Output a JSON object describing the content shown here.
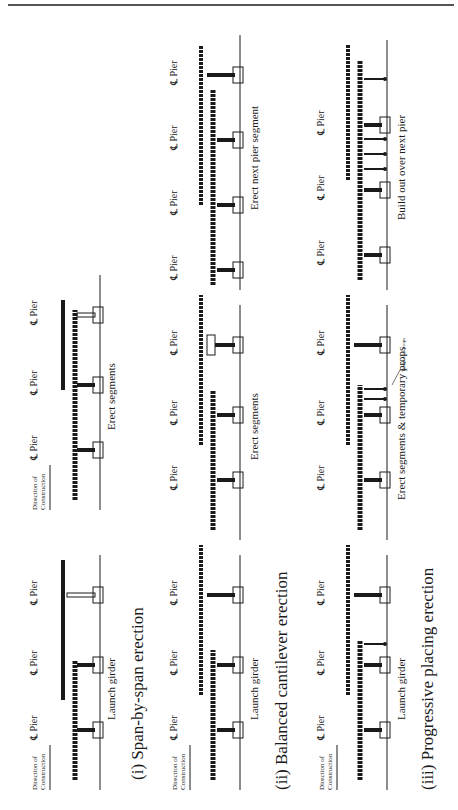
{
  "figure": {
    "orientation": "rotated-90-ccw",
    "sections": [
      {
        "caption": "(i) Span-by-span erection",
        "stages": [
          {
            "label": "Launch girder",
            "pier_label": "℄ Pier",
            "direction_label": [
              "Direction of",
              "Construction"
            ],
            "piers": 3
          },
          {
            "label": "Erect segments",
            "pier_label": "℄ Pier",
            "direction_label": [
              "Direction of",
              "Construction"
            ],
            "piers": 3
          }
        ]
      },
      {
        "caption": "(ii) Balanced cantilever erection",
        "stages": [
          {
            "label": "Launch girder",
            "pier_label": "℄ Pier",
            "direction_label": [
              "Direction of",
              "Construction"
            ],
            "piers": 3
          },
          {
            "label": "Erect segments",
            "pier_label": "℄ Pier",
            "piers": 3
          },
          {
            "label": "Erect next pier segment",
            "pier_label": "℄ Pier",
            "piers": 4
          }
        ]
      },
      {
        "caption": "(iii) Progressive placing erection",
        "stages": [
          {
            "label": "Launch girder",
            "pier_label": "℄ Pier",
            "direction_label": [
              "Direction of",
              "Construction"
            ],
            "piers": 3
          },
          {
            "label": "Erect segments & temporary props",
            "pier_label": "℄ Pier",
            "annotation": "Temporary props",
            "piers": 3
          },
          {
            "label": "Build out over next pier",
            "pier_label": "℄ Pier",
            "piers": 3
          }
        ]
      }
    ]
  },
  "colors": {
    "ink": "#1a1a1a",
    "rule": "#555555",
    "background": "#ffffff"
  }
}
